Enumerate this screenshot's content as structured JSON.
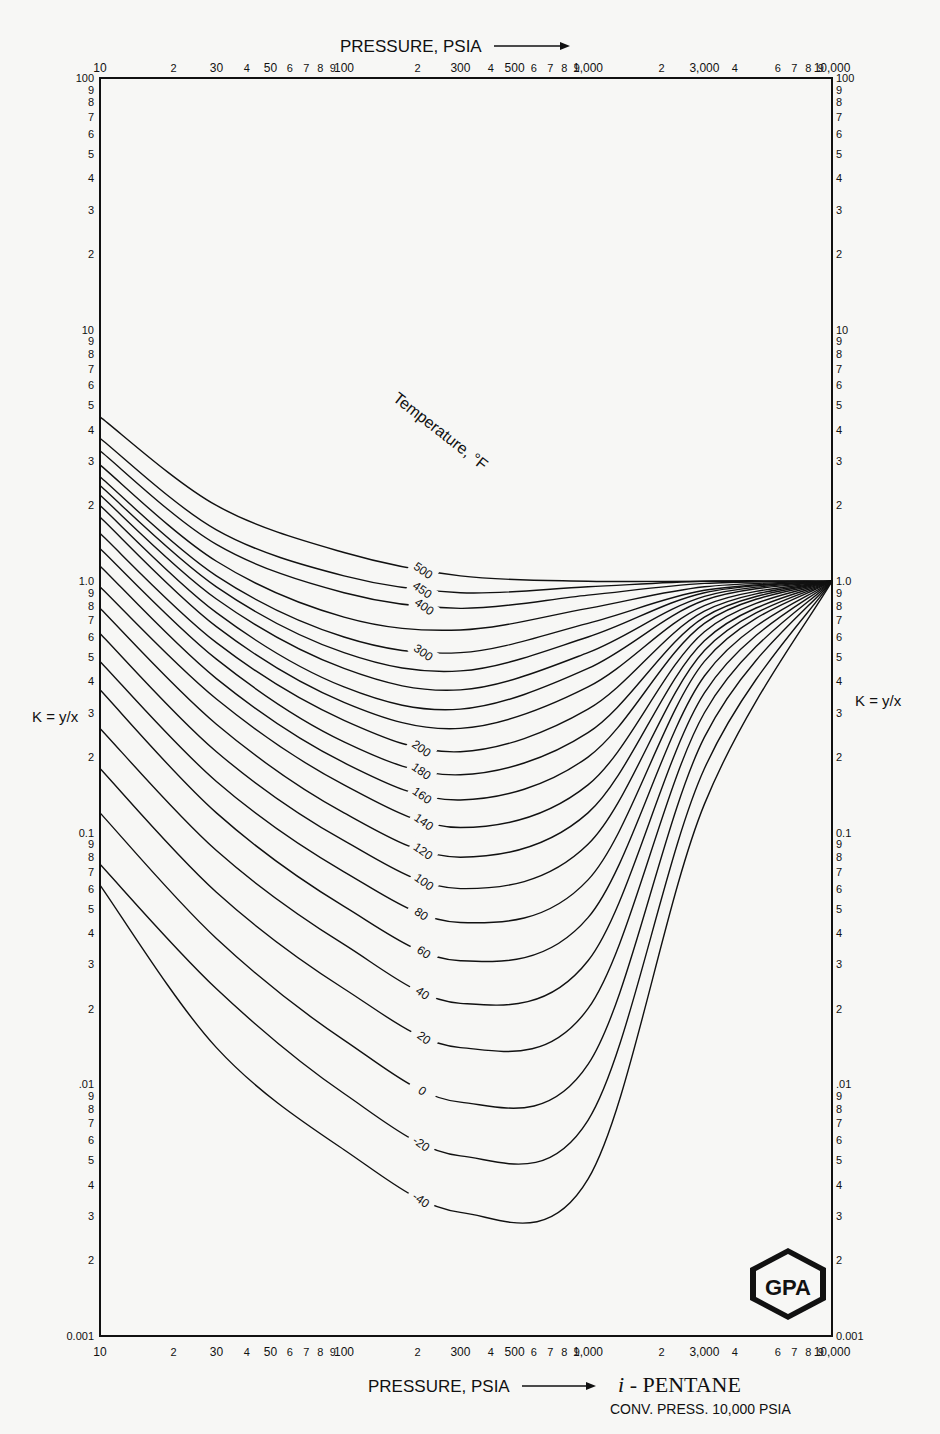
{
  "chart_data": {
    "type": "line",
    "subtitle": "CONV. PRESS. 10,000 PSIA",
    "xlabel": "PRESSURE, PSIA",
    "ylabel": "K = y/x",
    "x_scale": "log",
    "y_scale": "log",
    "xlim": [
      10,
      10000
    ],
    "ylim": [
      0.001,
      100
    ],
    "grid": false,
    "legend": "none (curve labels inline)",
    "curve_label_title": "Temperature, °F",
    "x_ticks_top": [
      "10",
      "2",
      "30",
      "4",
      "50",
      "6",
      "7",
      "8",
      "9",
      "100",
      "2",
      "300",
      "4",
      "500",
      "6",
      "7",
      "8",
      "9",
      "1,000",
      "2",
      "3,000",
      "4",
      "6",
      "7",
      "8",
      "9",
      "10,000"
    ],
    "x_ticks_bottom": [
      "10",
      "2",
      "30",
      "4",
      "50",
      "6",
      "7",
      "8",
      "9",
      "100",
      "2",
      "300",
      "4",
      "500",
      "6",
      "7",
      "8",
      "9",
      "1,000",
      "2",
      "3,000",
      "4",
      "6",
      "7",
      "8",
      "9",
      "10,000"
    ],
    "y_ticks_left": [
      "100",
      "9",
      "8",
      "7",
      "6",
      "5",
      "4",
      "3",
      "2",
      "10",
      "9",
      "8",
      "7",
      "6",
      "5",
      "4",
      "3",
      "2",
      "1.0",
      "9",
      "8",
      "7",
      "6",
      "5",
      "4",
      "3",
      "2",
      "0.1",
      "9",
      "8",
      "7",
      "6",
      "5",
      "4",
      "3",
      "2",
      ".01",
      "9",
      "8",
      "7",
      "6",
      "5",
      "4",
      "3",
      "2",
      "0.001"
    ],
    "y_ticks_right": [
      "100",
      "9",
      "8",
      "7",
      "6",
      "5",
      "4",
      "3",
      "2",
      "10",
      "9",
      "8",
      "7",
      "6",
      "5",
      "4",
      "3",
      "2",
      "1.0",
      "9",
      "8",
      "7",
      "6",
      "5",
      "4",
      "3",
      "2",
      "0.1",
      "9",
      "8",
      "7",
      "6",
      "5",
      "4",
      "3",
      "2",
      ".01",
      "9",
      "8",
      "7",
      "6",
      "5",
      "4",
      "3",
      "2",
      "0.001"
    ],
    "x": [
      10,
      30,
      100,
      300,
      1000,
      3000,
      10000
    ],
    "series": [
      {
        "name": "500",
        "values": [
          4.5,
          2.0,
          1.3,
          1.05,
          1.0,
          1.0,
          1.0
        ]
      },
      {
        "name": "450",
        "values": [
          3.7,
          1.6,
          1.05,
          0.9,
          0.95,
          1.0,
          1.0
        ]
      },
      {
        "name": "400",
        "values": [
          3.3,
          1.4,
          0.9,
          0.78,
          0.88,
          0.98,
          1.0
        ]
      },
      {
        "name": "350",
        "values": [
          2.9,
          1.2,
          0.72,
          0.64,
          0.78,
          0.95,
          1.0
        ]
      },
      {
        "name": "300",
        "values": [
          2.6,
          1.05,
          0.6,
          0.52,
          0.68,
          0.92,
          1.0
        ]
      },
      {
        "name": "280",
        "values": [
          2.4,
          0.95,
          0.52,
          0.44,
          0.6,
          0.9,
          1.0
        ]
      },
      {
        "name": "260",
        "values": [
          2.2,
          0.85,
          0.45,
          0.37,
          0.52,
          0.87,
          1.0
        ]
      },
      {
        "name": "240",
        "values": [
          2.0,
          0.75,
          0.38,
          0.31,
          0.45,
          0.84,
          1.0
        ]
      },
      {
        "name": "220",
        "values": [
          1.8,
          0.66,
          0.33,
          0.26,
          0.38,
          0.8,
          1.0
        ]
      },
      {
        "name": "200",
        "values": [
          1.55,
          0.57,
          0.28,
          0.21,
          0.31,
          0.76,
          1.0
        ]
      },
      {
        "name": "180",
        "values": [
          1.35,
          0.49,
          0.23,
          0.17,
          0.25,
          0.72,
          1.0
        ]
      },
      {
        "name": "160",
        "values": [
          1.15,
          0.41,
          0.19,
          0.135,
          0.2,
          0.68,
          1.0
        ]
      },
      {
        "name": "140",
        "values": [
          0.95,
          0.34,
          0.155,
          0.105,
          0.155,
          0.63,
          1.0
        ]
      },
      {
        "name": "120",
        "values": [
          0.78,
          0.27,
          0.12,
          0.08,
          0.12,
          0.58,
          1.0
        ]
      },
      {
        "name": "100",
        "values": [
          0.62,
          0.21,
          0.093,
          0.06,
          0.09,
          0.53,
          1.0
        ]
      },
      {
        "name": "80",
        "values": [
          0.48,
          0.16,
          0.07,
          0.044,
          0.065,
          0.48,
          1.0
        ]
      },
      {
        "name": "60",
        "values": [
          0.37,
          0.12,
          0.051,
          0.031,
          0.046,
          0.42,
          1.0
        ]
      },
      {
        "name": "40",
        "values": [
          0.26,
          0.085,
          0.036,
          0.021,
          0.031,
          0.36,
          1.0
        ]
      },
      {
        "name": "20",
        "values": [
          0.18,
          0.058,
          0.024,
          0.014,
          0.02,
          0.3,
          1.0
        ]
      },
      {
        "name": "0",
        "values": [
          0.12,
          0.038,
          0.015,
          0.0085,
          0.012,
          0.24,
          1.0
        ]
      },
      {
        "name": "-20",
        "values": [
          0.075,
          0.024,
          0.0092,
          0.0052,
          0.0072,
          0.18,
          1.0
        ]
      },
      {
        "name": "-40",
        "values": [
          0.062,
          0.014,
          0.0055,
          0.0031,
          0.0042,
          0.13,
          1.0
        ]
      }
    ]
  },
  "labels": {
    "top_axis_title": "PRESSURE, PSIA",
    "bottom_axis_title": "PRESSURE, PSIA",
    "left_k_label": "K = y/x",
    "right_k_label": "K = y/x",
    "temperature_title": "Temperature, °F",
    "compound": "i - PENTANE",
    "conv_press": "CONV. PRESS. 10,000 PSIA",
    "logo": "GPA",
    "curve_labels": [
      "500",
      "450",
      "400",
      "300",
      "200",
      "180",
      "160",
      "140",
      "120",
      "100",
      "80",
      "60",
      "40",
      "20",
      "0",
      "-20",
      "-40"
    ]
  }
}
